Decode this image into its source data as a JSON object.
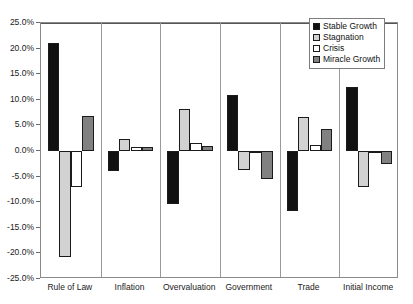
{
  "chart_data": {
    "type": "bar",
    "title": "",
    "subtitle": "",
    "xlabel": "",
    "ylabel": "",
    "categories": [
      "Rule of Law",
      "Inflation",
      "Overvaluation",
      "Government",
      "Trade",
      "Initial Income"
    ],
    "series": [
      {
        "name": "Stable Growth",
        "color": "#111111",
        "values": [
          21.0,
          -4.0,
          -10.3,
          11.0,
          -11.8,
          12.5
        ]
      },
      {
        "name": "Stagnation",
        "color": "#d2d2d2",
        "values": [
          -20.7,
          2.4,
          8.2,
          -3.8,
          6.7,
          -7.0
        ]
      },
      {
        "name": "Crisis",
        "color": "#ffffff",
        "values": [
          -7.0,
          0.7,
          1.6,
          -0.3,
          1.2,
          -0.2
        ]
      },
      {
        "name": "Miracle Growth",
        "color": "#818181",
        "values": [
          6.8,
          0.8,
          0.9,
          -5.5,
          4.2,
          -2.5
        ]
      }
    ],
    "ylim": [
      -25.0,
      25.0
    ],
    "ytick_values": [
      25.0,
      20.0,
      15.0,
      10.0,
      5.0,
      0.0,
      -5.0,
      -10.0,
      -15.0,
      -20.0,
      -25.0
    ],
    "ytick_labels": [
      "25.0%",
      "20.0%",
      "15.0%",
      "10.0%",
      "5.0%",
      "0.0%",
      "-5.0%",
      "-10.0%",
      "-15.0%",
      "-20.0%",
      "-25.0%"
    ],
    "grid": false,
    "zero_line": true,
    "category_separators": true,
    "legend": {
      "position": "top-right",
      "entries": [
        "Stable Growth",
        "Stagnation",
        "Crisis",
        "Miracle Growth"
      ]
    }
  }
}
